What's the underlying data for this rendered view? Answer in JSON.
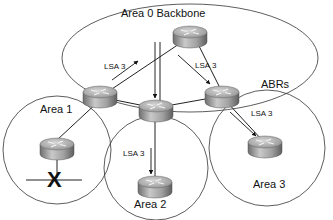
{
  "diagram": {
    "areas": [
      {
        "id": "area0",
        "label": "Area 0 Backbone"
      },
      {
        "id": "area1",
        "label": "Area 1"
      },
      {
        "id": "area2",
        "label": "Area 2"
      },
      {
        "id": "area3",
        "label": "Area 3"
      }
    ],
    "callouts": {
      "abrs": "ABRs"
    },
    "lsa_labels": [
      {
        "id": "lsa-area1-to-backbone",
        "text": "LSA 3"
      },
      {
        "id": "lsa-backbone-to-area3abr",
        "text": "LSA 3"
      },
      {
        "id": "lsa-area3",
        "text": "LSA 3"
      },
      {
        "id": "lsa-area2",
        "text": "LSA 3"
      }
    ],
    "routers": [
      {
        "id": "backbone-core",
        "role": "Backbone router"
      },
      {
        "id": "abr-area1",
        "role": "ABR (Area 1)"
      },
      {
        "id": "abr-area2",
        "role": "ABR (Area 2)"
      },
      {
        "id": "abr-area3",
        "role": "ABR (Area 3)"
      },
      {
        "id": "area1-internal",
        "role": "Internal router"
      },
      {
        "id": "area2-internal",
        "role": "Internal router"
      },
      {
        "id": "area3-internal",
        "role": "Internal router"
      }
    ],
    "failure_marker": "X",
    "colors": {
      "line": "#222222",
      "router_top": "#b8b8b8",
      "router_side": "#8a8a8a",
      "background": "#ffffff"
    }
  }
}
